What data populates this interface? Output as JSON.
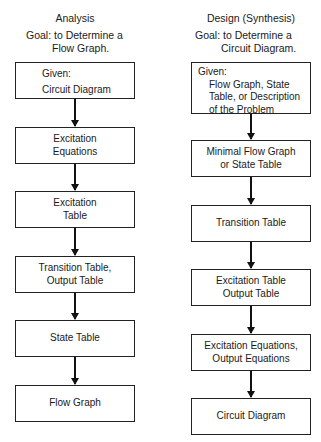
{
  "analysis": {
    "title": "Analysis",
    "goal_line1": "Goal: to Determine a",
    "goal_line2": "Flow Graph.",
    "given_label": "Given:",
    "given_value": "Circuit Diagram",
    "steps": [
      {
        "line1": "Excitation",
        "line2": "Equations"
      },
      {
        "line1": "Excitation",
        "line2": "Table"
      },
      {
        "line1": "Transition Table,",
        "line2": "Output Table"
      },
      {
        "line1": "State Table"
      },
      {
        "line1": "Flow Graph"
      }
    ]
  },
  "design": {
    "title": "Design (Synthesis)",
    "goal_line1": "Goal: to Determine a",
    "goal_line2": "Circuit Diagram.",
    "given_label": "Given:",
    "given_lines": [
      "Flow Graph, State",
      "Table, or Description",
      "of the Problem"
    ],
    "steps": [
      {
        "line1": "Minimal Flow Graph",
        "line2": "or State Table"
      },
      {
        "line1": "Transition Table"
      },
      {
        "line1": "Excitation Table",
        "line2": "Output Table"
      },
      {
        "line1": "Excitation Equations,",
        "line2": "Output Equations"
      },
      {
        "line1": "Circuit Diagram"
      }
    ]
  }
}
